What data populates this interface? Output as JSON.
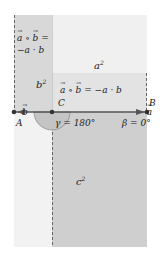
{
  "diagram": {
    "colors": {
      "background": "#ffffff",
      "b_strip_top": "#d8d8d8",
      "a_square_region": "#f0f0f0",
      "dot_band": "#e3e3e3",
      "c_square_region": "#cfcfcf",
      "lower_left_strip": "#f2f2f2",
      "line": "#555555",
      "angle_fill": "#c4c4c4",
      "dash": "#666666"
    },
    "labels": {
      "dot_left_line1": "a ∘ b =",
      "dot_left_line2": "−a · b",
      "a_sq": "a",
      "a_sq_exp": "2",
      "b_sq": "b",
      "b_sq_exp": "2",
      "dot_band_text": "a ∘ b = −a · b",
      "c_sq": "c",
      "c_sq_exp": "2",
      "point_A": "A",
      "point_B": "B",
      "point_C": "C",
      "vec_a": "a",
      "vec_b": "b",
      "gamma": "γ = 180°",
      "beta": "β = 0°"
    }
  }
}
